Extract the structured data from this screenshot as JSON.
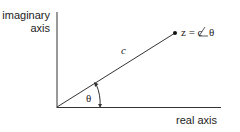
{
  "diagram": {
    "type": "complex-plane-polar-vector",
    "axes": {
      "vertical_label_line1": "imaginary",
      "vertical_label_line2": "axis",
      "horizontal_label": "real axis"
    },
    "vector": {
      "magnitude_label": "c",
      "point_label": "z = c",
      "angle_symbol": "θ"
    },
    "angle_label": "θ",
    "colors": {
      "line": "#333333",
      "text": "#222222",
      "background": "#ffffff"
    }
  }
}
